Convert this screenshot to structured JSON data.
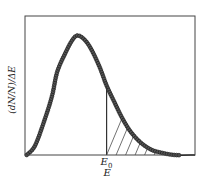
{
  "chart_data": {
    "type": "line",
    "title": "",
    "xlabel": "E",
    "ylabel": "(dN/N)/ΔE",
    "x_ticks": [
      {
        "label": "E0",
        "base": "E",
        "subscript": "0",
        "position": 0.48
      }
    ],
    "grid": false,
    "legend": null,
    "annotations": [
      "Hatched area under curve for E > E0",
      "Vertical line at E0"
    ],
    "xlim": [
      0,
      1
    ],
    "ylim": [
      0,
      1
    ],
    "series": [
      {
        "name": "distribution",
        "style": "solid line with dense circle markers",
        "x": [
          0.01,
          0.06,
          0.12,
          0.16,
          0.19,
          0.24,
          0.28,
          0.31,
          0.35,
          0.39,
          0.44,
          0.48,
          0.53,
          0.57,
          0.62,
          0.68,
          0.74,
          0.79,
          0.88,
          1.0
        ],
        "y": [
          0.0,
          0.07,
          0.27,
          0.43,
          0.6,
          0.74,
          0.83,
          0.86,
          0.83,
          0.76,
          0.63,
          0.5,
          0.37,
          0.27,
          0.17,
          0.09,
          0.04,
          0.02,
          0.0,
          0.0
        ]
      }
    ],
    "shaded_region": {
      "from": 0.48,
      "to": 0.88,
      "pattern": "diagonal hatch"
    }
  },
  "labels": {
    "ylabel": "(dN/N)/ΔE",
    "xtick_base": "E",
    "xtick_sub": "0",
    "xlabel": "E"
  },
  "colors": {
    "line": "#1a1a1a",
    "marker_fill": "#555555",
    "frame": "#444444",
    "hatch": "#333333"
  }
}
